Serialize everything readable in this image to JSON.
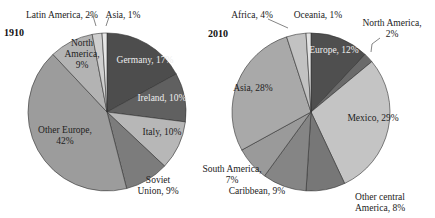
{
  "chart_data": [
    {
      "type": "pie",
      "title": "1910",
      "center": [
        107,
        112
      ],
      "radius": 79,
      "start_angle_deg": 0,
      "slices": [
        {
          "label": "Germany",
          "value": 17,
          "text": "Germany, 17%",
          "color": "#4d4d4d",
          "lx": 145,
          "ly": 63,
          "light": true
        },
        {
          "label": "Ireland",
          "value": 10,
          "text": "Ireland, 10%",
          "color": "#606060",
          "lx": 162,
          "ly": 101,
          "light": true
        },
        {
          "label": "Italy",
          "value": 10,
          "text": "Italy, 10%",
          "color": "#b7b7b7",
          "lx": 162,
          "ly": 135
        },
        {
          "label": "Soviet Union",
          "value": 9,
          "text": "Soviet|Union, 9%",
          "color": "#7c7c7c",
          "lx": 158,
          "ly": 183,
          "ext": true
        },
        {
          "label": "Other Europe",
          "value": 42,
          "text": "Other Europe,|42%",
          "color": "#9c9c9c",
          "lx": 65,
          "ly": 133
        },
        {
          "label": "North America",
          "value": 9,
          "text": "North|America,|9%",
          "color": "#b3b3b3",
          "lx": 82,
          "ly": 46
        },
        {
          "label": "Latin America",
          "value": 2,
          "text": "Latin America, 2%",
          "color": "#cfcfcf",
          "lx": 62,
          "ly": 18,
          "ext": true
        },
        {
          "label": "Asia",
          "value": 1,
          "text": "Asia, 1%",
          "color": "#e6e6e6",
          "lx": 123,
          "ly": 18,
          "ext": true
        }
      ]
    },
    {
      "type": "pie",
      "title": "2010",
      "center": [
        311,
        112
      ],
      "radius": 79,
      "start_angle_deg": 0,
      "slices": [
        {
          "label": "Europe",
          "value": 12,
          "text": "Europe, 12%",
          "color": "#4f4f4f",
          "lx": 334,
          "ly": 53,
          "light": true
        },
        {
          "label": "North America",
          "value": 2,
          "text": "North America,|2%",
          "color": "#6a6a6a",
          "lx": 392,
          "ly": 26,
          "ext": true
        },
        {
          "label": "Mexico",
          "value": 29,
          "text": "Mexico, 29%",
          "color": "#c4c4c4",
          "lx": 373,
          "ly": 121
        },
        {
          "label": "Other central America",
          "value": 8,
          "text": "Other central|America, 8%",
          "color": "#777777",
          "lx": 380,
          "ly": 200,
          "ext": true
        },
        {
          "label": "Caribbean",
          "value": 9,
          "text": "Caribbean, 9%",
          "color": "#858585",
          "lx": 257,
          "ly": 194,
          "ext": true
        },
        {
          "label": "South America",
          "value": 7,
          "text": "South America,|7%",
          "color": "#9a9a9a",
          "lx": 232,
          "ly": 172,
          "ext": true
        },
        {
          "label": "Asia",
          "value": 28,
          "text": "Asia, 28%",
          "color": "#a9a9a9",
          "lx": 253,
          "ly": 91
        },
        {
          "label": "Africa",
          "value": 4,
          "text": "Africa, 4%",
          "color": "#c2c2c2",
          "lx": 252,
          "ly": 18,
          "ext": true
        },
        {
          "label": "Oceania",
          "value": 1,
          "text": "Oceania, 1%",
          "color": "#e2e2e2",
          "lx": 318,
          "ly": 18,
          "ext": true
        }
      ]
    }
  ],
  "years": {
    "left": "1910",
    "right": "2010"
  }
}
